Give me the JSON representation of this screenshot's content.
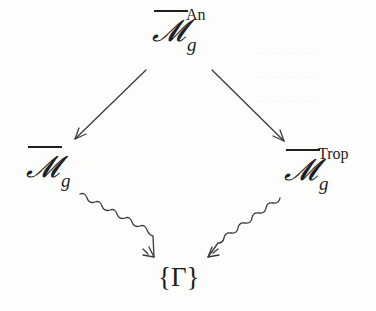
{
  "diagram": {
    "type": "commutative-diagram",
    "nodes": {
      "top": {
        "base": "𝓜",
        "overline": true,
        "subscript": "g",
        "superscript": "An"
      },
      "left": {
        "base": "𝓜",
        "overline": true,
        "subscript": "g",
        "superscript": ""
      },
      "right": {
        "base": "𝓜",
        "overline": true,
        "subscript": "g",
        "superscript": "Trop"
      },
      "bottom": {
        "label": "{Γ}"
      }
    },
    "edges": [
      {
        "from": "top",
        "to": "left",
        "style": "straight-arrow"
      },
      {
        "from": "top",
        "to": "right",
        "style": "straight-arrow"
      },
      {
        "from": "left",
        "to": "bottom",
        "style": "squiggly-arrow"
      },
      {
        "from": "right",
        "to": "bottom",
        "style": "squiggly-arrow"
      }
    ],
    "colors": {
      "ink": "#1e1e1e",
      "arrow": "#3a3a3a",
      "background": "#fdfdfc"
    }
  }
}
